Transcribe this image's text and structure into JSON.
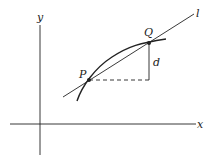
{
  "diagram": {
    "title": "",
    "labels": {
      "y_axis": "y",
      "x_axis": "x",
      "line": "l",
      "point_p": "P",
      "point_q": "Q",
      "vertical_distance": "d"
    },
    "colors": {
      "stroke": "#222222",
      "background": "#ffffff"
    },
    "elements": {
      "x_axis": {
        "from": [
          10,
          124
        ],
        "to": [
          196,
          124
        ]
      },
      "y_axis": {
        "from": [
          40,
          25
        ],
        "to": [
          40,
          155
        ]
      },
      "secant_line_l": {
        "from": [
          63,
          97
        ],
        "to": [
          194,
          14
        ]
      },
      "curve": {
        "description": "concave-down curve passing through P and Q"
      },
      "point_P": [
        89,
        80
      ],
      "point_Q": [
        149,
        43
      ],
      "dashed_horizontal": {
        "from": [
          89,
          80
        ],
        "to": [
          149,
          80
        ]
      },
      "vertical_segment_d": {
        "from": [
          149,
          43
        ],
        "to": [
          149,
          80
        ]
      }
    }
  }
}
